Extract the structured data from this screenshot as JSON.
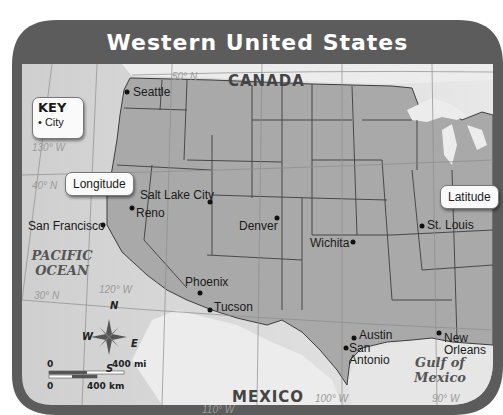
{
  "title": "Western United States",
  "key": {
    "title": "KEY",
    "item_label": "City",
    "item_symbol": "•"
  },
  "callouts": {
    "longitude": "Longitude",
    "latitude": "Latitude"
  },
  "countries": {
    "north": "CANADA",
    "south": "MEXICO"
  },
  "water_bodies": {
    "pacific_line1": "PACIFIC",
    "pacific_line2": "OCEAN",
    "gulf_line1": "Gulf of",
    "gulf_line2": "Mexico"
  },
  "gridlines": {
    "lat_50": "50° N",
    "lat_40": "40° N",
    "lat_30": "30° N",
    "lon_130": "130° W",
    "lon_120": "120° W",
    "lon_110": "110° W",
    "lon_100": "100° W",
    "lon_90": "90° W"
  },
  "cities": [
    {
      "name": "Seattle"
    },
    {
      "name": "Salt Lake City"
    },
    {
      "name": "Reno"
    },
    {
      "name": "San Francisco"
    },
    {
      "name": "Denver"
    },
    {
      "name": "Wichita"
    },
    {
      "name": "St. Louis"
    },
    {
      "name": "Phoenix"
    },
    {
      "name": "Tucson"
    },
    {
      "name": "Austin"
    },
    {
      "name": "San",
      "name2": "Antonio"
    },
    {
      "name": "New",
      "name2": "Orleans"
    }
  ],
  "compass": {
    "n": "N",
    "s": "S",
    "e": "E",
    "w": "W"
  },
  "scale": {
    "zero_top": "0",
    "miles": "400 mi",
    "zero_bottom": "0",
    "km": "400 km"
  },
  "colors": {
    "frame": "#5c5c5c",
    "states": "#a9a9a9",
    "ocean": "#d6d6d6",
    "neighbor_land": "#ececec",
    "border_line": "#3d3d3d",
    "grid_line": "#8c8c8c"
  }
}
